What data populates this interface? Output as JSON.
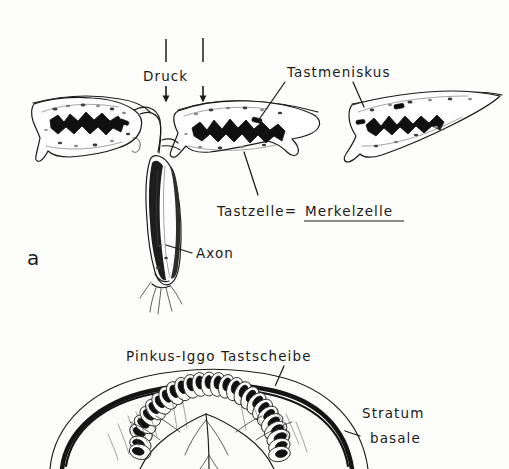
{
  "figure": {
    "background_color": "#fdfdfc",
    "ink_color": "#1a1a1a",
    "panels": [
      {
        "letter": "a",
        "labels": [
          "Druck",
          "Tastmeniskus",
          "Tastzelle=",
          "Merkelzelle",
          "Axon"
        ]
      },
      {
        "letter": "",
        "labels": [
          "Pinkus-Iggo  Tastscheibe",
          "Stratum",
          "basale"
        ]
      }
    ]
  },
  "panel_a": {
    "letter": "a",
    "pressure_label": "Druck",
    "meniscus_label": "Tastmeniskus",
    "touchcell_label": "Tastzelle=",
    "merkel_label": "Merkelzelle",
    "axon_label": "Axon"
  },
  "panel_b": {
    "disc_label": "Pinkus-Iggo  Tastscheibe",
    "stratum_label_line1": "Stratum",
    "stratum_label_line2": "basale"
  }
}
